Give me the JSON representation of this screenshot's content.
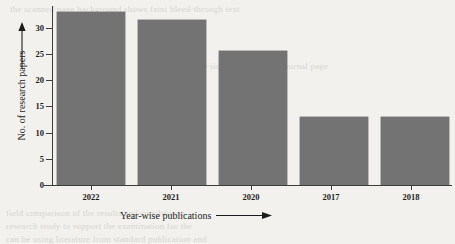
{
  "chart_data": {
    "type": "bar",
    "title": "",
    "subtitle": "",
    "categories": [
      "2022",
      "2021",
      "2020",
      "2017",
      "2018"
    ],
    "values": [
      33,
      31.5,
      25.5,
      13,
      13
    ],
    "series": [
      {
        "name": "No. of research papers",
        "values": [
          33,
          31.5,
          25.5,
          13,
          13
        ]
      }
    ],
    "xlabel": "Year-wise publications",
    "ylabel": "No. of research papers",
    "ylim": [
      0,
      35
    ],
    "ytick_values": [
      0,
      5,
      10,
      15,
      20,
      25,
      30
    ],
    "ytick_labels": [
      "0",
      "5",
      "10",
      "15",
      "20",
      "25",
      "30"
    ],
    "grid": false,
    "legend": false,
    "legend_position": "none",
    "bar_color": "#737373",
    "axis_color": "#3d3d3d",
    "background_color": "#f2f1ee",
    "xlabel_arrow": "right-arrow",
    "ylabel_arrow": "up-arrow"
  },
  "axis": {
    "x_title": "Year-wise publications",
    "y_title": "No. of research papers"
  },
  "background_text": {
    "lines": [
      "the scanned page background shows faint bleed-through text",
      "from the reverse side of the printed journal page",
      "field  comparison  of  the  results  and  conclusions",
      "research study  to  support  the  examination  for  the",
      "can  be  using  literature  from  standard  publication  and"
    ]
  }
}
